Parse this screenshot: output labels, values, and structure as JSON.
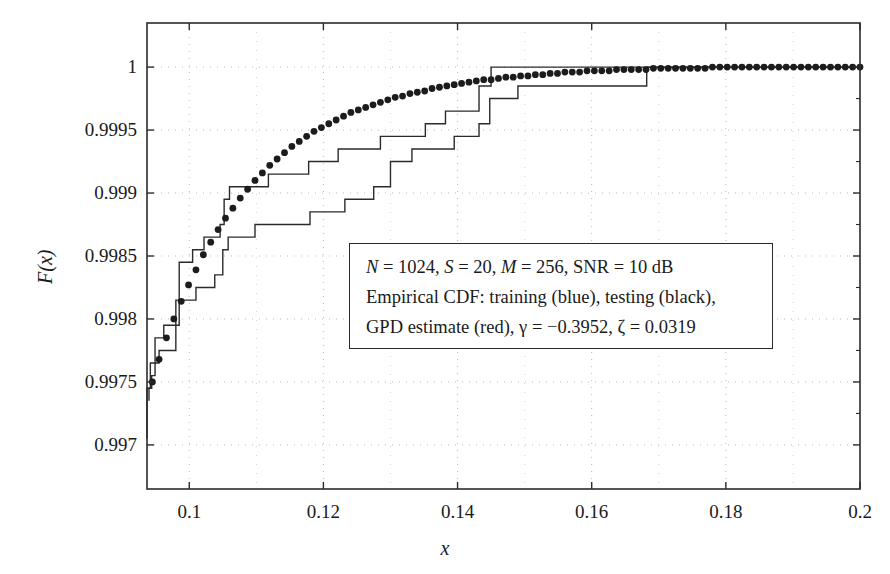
{
  "chart_data": {
    "type": "line",
    "title": "",
    "xlabel": "x",
    "ylabel": "F(x)",
    "xlim": [
      0.0937,
      0.2
    ],
    "ylim": [
      0.99665,
      1.00035
    ],
    "grid": true,
    "xticks": [
      0.1,
      0.12,
      0.14,
      0.16,
      0.18,
      0.2
    ],
    "xticklabels": [
      "0.1",
      "0.12",
      "0.14",
      "0.16",
      "0.18",
      "0.2"
    ],
    "yticks": [
      0.997,
      0.9975,
      0.998,
      0.9985,
      0.999,
      0.9995,
      1
    ],
    "yticklabels": [
      "0.997",
      "0.9975",
      "0.998",
      "0.9985",
      "0.999",
      "0.9995",
      "1"
    ],
    "legend_position": "center-right-inside",
    "series": [
      {
        "name": "Empirical CDF: training (blue)",
        "style": "step",
        "color": "#2b2b2b",
        "points": [
          [
            0.094,
            0.99735
          ],
          [
            0.094,
            0.99745
          ],
          [
            0.0944,
            0.99745
          ],
          [
            0.0944,
            0.99755
          ],
          [
            0.0949,
            0.99755
          ],
          [
            0.0949,
            0.99785
          ],
          [
            0.0962,
            0.99785
          ],
          [
            0.0962,
            0.99795
          ],
          [
            0.0985,
            0.99795
          ],
          [
            0.0985,
            0.99845
          ],
          [
            0.1005,
            0.99845
          ],
          [
            0.1005,
            0.99855
          ],
          [
            0.1022,
            0.99855
          ],
          [
            0.1022,
            0.99865
          ],
          [
            0.1046,
            0.99865
          ],
          [
            0.1046,
            0.99875
          ],
          [
            0.1052,
            0.99875
          ],
          [
            0.1052,
            0.99895
          ],
          [
            0.106,
            0.99895
          ],
          [
            0.106,
            0.99905
          ],
          [
            0.1118,
            0.99905
          ],
          [
            0.1118,
            0.99915
          ],
          [
            0.1178,
            0.99915
          ],
          [
            0.1178,
            0.99925
          ],
          [
            0.1222,
            0.99925
          ],
          [
            0.1222,
            0.99935
          ],
          [
            0.1285,
            0.99935
          ],
          [
            0.1285,
            0.99945
          ],
          [
            0.1352,
            0.99945
          ],
          [
            0.1352,
            0.99955
          ],
          [
            0.1382,
            0.99955
          ],
          [
            0.1382,
            0.99965
          ],
          [
            0.1432,
            0.99965
          ],
          [
            0.1432,
            0.99985
          ],
          [
            0.145,
            0.99985
          ],
          [
            0.145,
            1.0
          ],
          [
            0.2,
            1.0
          ]
        ]
      },
      {
        "name": "Empirical CDF: testing (black)",
        "style": "step",
        "color": "#2b2b2b",
        "points": [
          [
            0.0937,
            0.99705
          ],
          [
            0.0937,
            0.99745
          ],
          [
            0.0942,
            0.99745
          ],
          [
            0.0942,
            0.99765
          ],
          [
            0.0955,
            0.99765
          ],
          [
            0.0955,
            0.99775
          ],
          [
            0.098,
            0.99775
          ],
          [
            0.098,
            0.99815
          ],
          [
            0.101,
            0.99815
          ],
          [
            0.101,
            0.99825
          ],
          [
            0.1038,
            0.99825
          ],
          [
            0.1038,
            0.99835
          ],
          [
            0.105,
            0.99835
          ],
          [
            0.105,
            0.99855
          ],
          [
            0.1058,
            0.99855
          ],
          [
            0.1058,
            0.99865
          ],
          [
            0.1098,
            0.99865
          ],
          [
            0.1098,
            0.99875
          ],
          [
            0.118,
            0.99875
          ],
          [
            0.118,
            0.99885
          ],
          [
            0.1232,
            0.99885
          ],
          [
            0.1232,
            0.99895
          ],
          [
            0.1275,
            0.99895
          ],
          [
            0.1275,
            0.99905
          ],
          [
            0.13,
            0.99905
          ],
          [
            0.13,
            0.99925
          ],
          [
            0.1332,
            0.99925
          ],
          [
            0.1332,
            0.99935
          ],
          [
            0.1395,
            0.99935
          ],
          [
            0.1395,
            0.99945
          ],
          [
            0.1432,
            0.99945
          ],
          [
            0.1432,
            0.99955
          ],
          [
            0.1448,
            0.99955
          ],
          [
            0.1448,
            0.99975
          ],
          [
            0.149,
            0.99975
          ],
          [
            0.149,
            0.99985
          ],
          [
            0.1682,
            0.99985
          ],
          [
            0.1682,
            1.0
          ],
          [
            0.2,
            1.0
          ]
        ]
      },
      {
        "name": "GPD estimate (red)",
        "style": "dotted",
        "color": "#1c1c1c",
        "points": [
          [
            0.0945,
            0.9975
          ],
          [
            0.0955,
            0.99768
          ],
          [
            0.0966,
            0.99785
          ],
          [
            0.0977,
            0.998
          ],
          [
            0.0988,
            0.99814
          ],
          [
            0.0999,
            0.99827
          ],
          [
            0.101,
            0.99839
          ],
          [
            0.1021,
            0.99851
          ],
          [
            0.1032,
            0.99861
          ],
          [
            0.1043,
            0.99871
          ],
          [
            0.1054,
            0.9988
          ],
          [
            0.1065,
            0.99888
          ],
          [
            0.1076,
            0.99896
          ],
          [
            0.1087,
            0.99903
          ],
          [
            0.1098,
            0.9991
          ],
          [
            0.1109,
            0.99916
          ],
          [
            0.112,
            0.99922
          ],
          [
            0.1131,
            0.99927
          ],
          [
            0.1142,
            0.99932
          ],
          [
            0.1153,
            0.99937
          ],
          [
            0.1164,
            0.99941
          ],
          [
            0.1175,
            0.99945
          ],
          [
            0.1186,
            0.99949
          ],
          [
            0.1197,
            0.99952
          ],
          [
            0.1208,
            0.99955
          ],
          [
            0.1219,
            0.99958
          ],
          [
            0.123,
            0.99961
          ],
          [
            0.1241,
            0.99964
          ],
          [
            0.1252,
            0.99966
          ],
          [
            0.1263,
            0.99968
          ],
          [
            0.1274,
            0.9997
          ],
          [
            0.1285,
            0.99972
          ],
          [
            0.1296,
            0.99974
          ],
          [
            0.1307,
            0.99976
          ],
          [
            0.1318,
            0.99977
          ],
          [
            0.1329,
            0.99979
          ],
          [
            0.134,
            0.9998
          ],
          [
            0.1351,
            0.99981
          ],
          [
            0.1362,
            0.99983
          ],
          [
            0.1373,
            0.99984
          ],
          [
            0.1384,
            0.99985
          ],
          [
            0.1395,
            0.99986
          ],
          [
            0.1406,
            0.99987
          ],
          [
            0.1417,
            0.99988
          ],
          [
            0.1428,
            0.99989
          ],
          [
            0.1439,
            0.9999
          ],
          [
            0.145,
            0.9999
          ],
          [
            0.1461,
            0.99991
          ],
          [
            0.1472,
            0.99992
          ],
          [
            0.1483,
            0.99992
          ],
          [
            0.1494,
            0.99993
          ],
          [
            0.1505,
            0.99993
          ],
          [
            0.1516,
            0.99994
          ],
          [
            0.1527,
            0.99994
          ],
          [
            0.1538,
            0.99995
          ],
          [
            0.1549,
            0.99995
          ],
          [
            0.156,
            0.99996
          ],
          [
            0.1571,
            0.99996
          ],
          [
            0.1582,
            0.99996
          ],
          [
            0.1593,
            0.99997
          ],
          [
            0.1604,
            0.99997
          ],
          [
            0.1615,
            0.99997
          ],
          [
            0.1626,
            0.99997
          ],
          [
            0.1637,
            0.99998
          ],
          [
            0.1648,
            0.99998
          ],
          [
            0.1659,
            0.99998
          ],
          [
            0.167,
            0.99998
          ],
          [
            0.1681,
            0.99998
          ],
          [
            0.1692,
            0.99999
          ],
          [
            0.1703,
            0.99999
          ],
          [
            0.1714,
            0.99999
          ],
          [
            0.1725,
            0.99999
          ],
          [
            0.1736,
            0.99999
          ],
          [
            0.1747,
            0.99999
          ],
          [
            0.1758,
            0.99999
          ],
          [
            0.1769,
            0.99999
          ],
          [
            0.178,
            1.0
          ],
          [
            0.1791,
            1.0
          ],
          [
            0.1802,
            1.0
          ],
          [
            0.1813,
            1.0
          ],
          [
            0.1824,
            1.0
          ],
          [
            0.1835,
            1.0
          ],
          [
            0.1846,
            1.0
          ],
          [
            0.1857,
            1.0
          ],
          [
            0.1868,
            1.0
          ],
          [
            0.1879,
            1.0
          ],
          [
            0.189,
            1.0
          ],
          [
            0.1901,
            1.0
          ],
          [
            0.1912,
            1.0
          ],
          [
            0.1923,
            1.0
          ],
          [
            0.1934,
            1.0
          ],
          [
            0.1945,
            1.0
          ],
          [
            0.1956,
            1.0
          ],
          [
            0.1967,
            1.0
          ],
          [
            0.1978,
            1.0
          ],
          [
            0.1989,
            1.0
          ],
          [
            0.2,
            1.0
          ]
        ]
      }
    ]
  },
  "annotation": {
    "line1_parts": {
      "N_sym": "N",
      "N_eq": " = 1024, ",
      "S_sym": "S",
      "S_eq": " = 20, ",
      "M_sym": "M",
      "M_eq": " = 256, SNR = 10 dB"
    },
    "line2": "Empirical CDF: training (blue), testing (black),",
    "line3_parts": {
      "pre": "GPD estimate (red), γ = −0.3952, ζ = 0.0319"
    },
    "line1_plain": "N = 1024, S = 20, M = 256, SNR = 10 dB",
    "line3_plain": "GPD estimate (red), γ = −0.3952, ζ = 0.0319"
  },
  "style": {
    "axis_color": "#2b2b2b",
    "grid_color": "#b9b9b9",
    "curve_color": "#2b2b2b",
    "dot_color": "#1c1c1c",
    "background": "#ffffff"
  }
}
